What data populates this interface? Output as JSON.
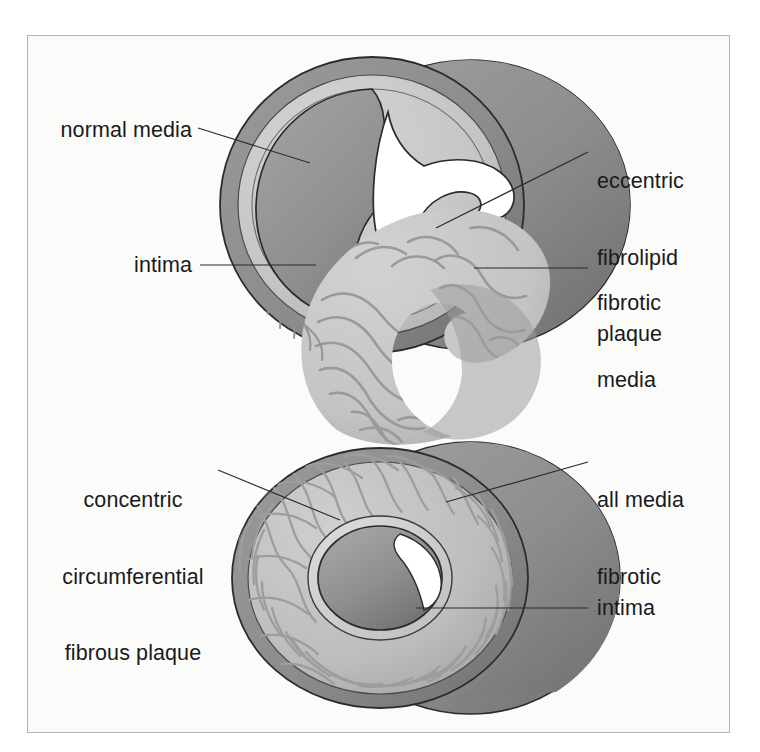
{
  "figure": {
    "border_color": "#b4b4b4",
    "background_color": "#fbfbfa",
    "ink_color": "#1a1a1a"
  },
  "palette": {
    "adventitia_dark": "#8e8e8e",
    "cylinder_shadow": "#7d7d7d",
    "media_light": "#c7c7c7",
    "media_light_2": "#d2d2d2",
    "lumen_dark": "#949494",
    "lumen_dark_2": "#808080",
    "plaque_fill": "#c9c9c9",
    "plaque_streak": "#9a9a9a",
    "fibrous_streak": "#9d9d9d",
    "highlight_white": "#ffffff",
    "outline": "#2b2b2b",
    "leader_line": "#2b2b2b"
  },
  "top_figure": {
    "name": "eccentric-fibrolipid-plaque-vessel",
    "labels": [
      {
        "id": "normal-media",
        "text": "normal media",
        "lines": [
          "normal media"
        ],
        "align": "right",
        "x": 58,
        "y": 118,
        "width": 134
      },
      {
        "id": "intima-top",
        "text": "intima",
        "lines": [
          "intima"
        ],
        "align": "right",
        "x": 110,
        "y": 253,
        "width": 82
      },
      {
        "id": "eccentric-plaque",
        "text": "eccentric fibrolipid plaque",
        "lines": [
          "eccentric",
          "fibrolipid",
          "plaque"
        ],
        "align": "left",
        "x": 597,
        "y": 118,
        "width": 150
      },
      {
        "id": "fibrotic-media",
        "text": "fibrotic media",
        "lines": [
          "fibrotic",
          "media"
        ],
        "align": "left",
        "x": 597,
        "y": 240,
        "width": 150
      }
    ]
  },
  "bottom_figure": {
    "name": "concentric-fibrous-plaque-vessel",
    "labels": [
      {
        "id": "concentric-plaque",
        "text": "concentric circumferential fibrous plaque",
        "lines": [
          "concentric",
          "circumferential",
          "fibrous plaque"
        ],
        "align": "center",
        "x": 58,
        "y": 437,
        "width": 152
      },
      {
        "id": "all-media-fibrotic",
        "text": "all media fibrotic",
        "lines": [
          "all media",
          "fibrotic"
        ],
        "align": "left",
        "x": 597,
        "y": 437,
        "width": 150
      },
      {
        "id": "intima-bottom",
        "text": "intima",
        "lines": [
          "intima"
        ],
        "align": "left",
        "x": 597,
        "y": 596,
        "width": 150
      }
    ]
  }
}
